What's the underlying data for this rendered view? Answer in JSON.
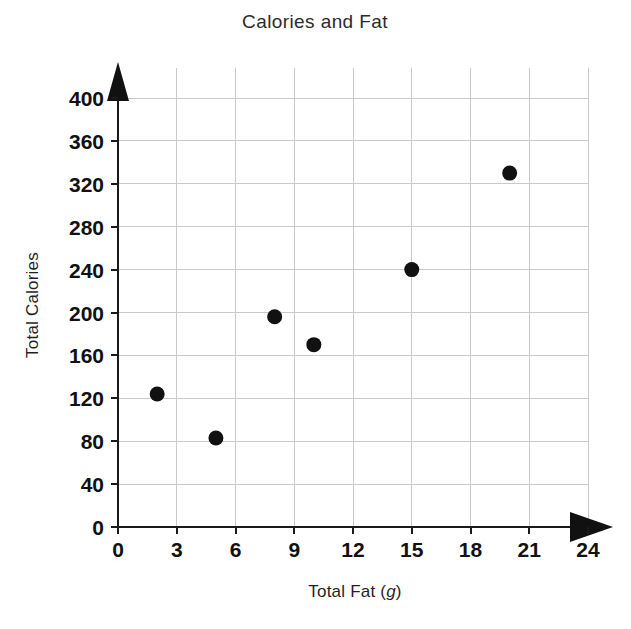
{
  "chart_data": {
    "type": "scatter",
    "title": "Calories and Fat",
    "xlabel": "Total Fat (g)",
    "xlabel_main": "Total Fat (",
    "xlabel_italic": "g",
    "xlabel_close": ")",
    "ylabel": "Total Calories",
    "xlim": [
      0,
      24
    ],
    "ylim": [
      0,
      400
    ],
    "xticks": [
      0,
      3,
      6,
      9,
      12,
      15,
      18,
      21,
      24
    ],
    "yticks": [
      0,
      40,
      80,
      120,
      160,
      200,
      240,
      280,
      320,
      360,
      400
    ],
    "xtick_labels": [
      "0",
      "3",
      "6",
      "9",
      "12",
      "15",
      "18",
      "21",
      "24"
    ],
    "ytick_labels": [
      "0",
      "40",
      "80",
      "120",
      "160",
      "200",
      "240",
      "280",
      "320",
      "360",
      "400"
    ],
    "grid": true,
    "legend": false,
    "marker": "filled-circle",
    "marker_color": "#111111",
    "grid_color": "#c9c9c9",
    "axis_color": "#1a1a1a",
    "background_color": "#ffffff",
    "points": [
      {
        "x": 2,
        "y": 124
      },
      {
        "x": 5,
        "y": 83
      },
      {
        "x": 8,
        "y": 196
      },
      {
        "x": 10,
        "y": 170
      },
      {
        "x": 15,
        "y": 240
      },
      {
        "x": 20,
        "y": 330
      }
    ]
  }
}
